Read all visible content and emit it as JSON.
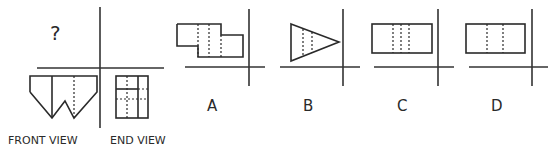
{
  "question": {
    "unknown_view_mark": "?",
    "front_view_label": "FRONT VIEW",
    "end_view_label": "END VIEW"
  },
  "options": [
    {
      "label": "A",
      "shape": "stepped-rectangles",
      "hidden_lines": 3
    },
    {
      "label": "B",
      "shape": "triangle",
      "hidden_lines": 2
    },
    {
      "label": "C",
      "shape": "rectangle",
      "hidden_lines": 3
    },
    {
      "label": "D",
      "shape": "rectangle",
      "hidden_lines": 2
    }
  ],
  "colors": {
    "line": "#2a2a2a",
    "background": "#ffffff"
  }
}
